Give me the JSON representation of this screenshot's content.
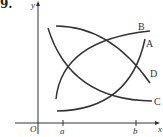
{
  "problem_number": "9.",
  "axes": {
    "x_label": "x",
    "y_label": "y",
    "origin_label": "O",
    "x_ticks": [
      "a",
      "b"
    ]
  },
  "curves": [
    {
      "label": "A",
      "description": "increasing, concave up"
    },
    {
      "label": "B",
      "description": "increasing, concave down"
    },
    {
      "label": "C",
      "description": "decreasing, concave up"
    },
    {
      "label": "D",
      "description": "decreasing, concave down"
    }
  ],
  "colors": {
    "ink": "#333333",
    "background": "#ffffff"
  }
}
